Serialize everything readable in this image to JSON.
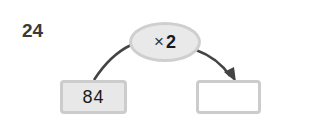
{
  "question": {
    "number": "24"
  },
  "operation": {
    "operator": "×",
    "operand": "2"
  },
  "input_box": {
    "value": "84"
  },
  "output_box": {
    "value": ""
  },
  "colors": {
    "box_fill": "#e8e8e8",
    "box_border": "#cccccc",
    "arrow": "#444444",
    "text": "#1a1a1a"
  }
}
